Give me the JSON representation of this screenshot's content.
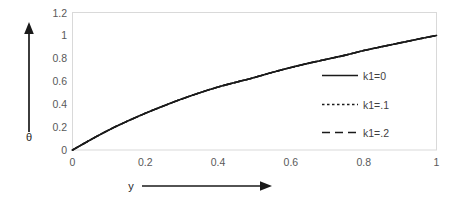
{
  "chart_data": {
    "type": "line",
    "title": "",
    "xlabel": "y",
    "ylabel": "θ",
    "xlim": [
      0,
      1
    ],
    "ylim": [
      0,
      1.2
    ],
    "grid": false,
    "legend_position": "inside-right",
    "x_ticks": [
      "0",
      "0.2",
      "0.4",
      "0.6",
      "0.8",
      "1"
    ],
    "x_tick_values": [
      0,
      0.2,
      0.4,
      0.6,
      0.8,
      1
    ],
    "y_ticks": [
      "0",
      "0.2",
      "0.4",
      "0.6",
      "0.8",
      "1",
      "1.2"
    ],
    "y_tick_values": [
      0,
      0.2,
      0.4,
      0.6,
      0.8,
      1,
      1.2
    ],
    "x": [
      0,
      0.05,
      0.1,
      0.15,
      0.2,
      0.25,
      0.3,
      0.35,
      0.4,
      0.45,
      0.5,
      0.55,
      0.6,
      0.65,
      0.7,
      0.75,
      0.8,
      0.85,
      0.9,
      0.95,
      1
    ],
    "series": [
      {
        "name": "k1=0",
        "style": "solid",
        "color": "#1a1a1a",
        "values": [
          0,
          0.09,
          0.175,
          0.25,
          0.32,
          0.385,
          0.445,
          0.5,
          0.55,
          0.592,
          0.633,
          0.678,
          0.72,
          0.758,
          0.793,
          0.828,
          0.868,
          0.902,
          0.935,
          0.968,
          1.0
        ]
      },
      {
        "name": "k1=.1",
        "style": "dotted",
        "color": "#1a1a1a",
        "values": [
          0,
          0.09,
          0.175,
          0.25,
          0.32,
          0.385,
          0.445,
          0.5,
          0.55,
          0.592,
          0.633,
          0.678,
          0.72,
          0.758,
          0.793,
          0.828,
          0.868,
          0.902,
          0.935,
          0.968,
          1.0
        ]
      },
      {
        "name": "k1=.2",
        "style": "dashed",
        "color": "#1a1a1a",
        "values": [
          0,
          0.09,
          0.175,
          0.25,
          0.32,
          0.385,
          0.445,
          0.5,
          0.55,
          0.592,
          0.633,
          0.678,
          0.72,
          0.758,
          0.793,
          0.828,
          0.868,
          0.902,
          0.935,
          0.968,
          1.0
        ]
      }
    ],
    "legend": [
      {
        "label": "k1=0",
        "style": "solid"
      },
      {
        "label": "k1=.1",
        "style": "dotted"
      },
      {
        "label": "k1=.2",
        "style": "dashed"
      }
    ],
    "annotations": {
      "y_axis_arrow": "upward-arrow",
      "x_axis_arrow": "rightward-arrow"
    },
    "colors": {
      "curve": "#1a1a1a",
      "plot_border": "#d9d9d9",
      "tick_text": "#595959",
      "axis_title": "#262626",
      "background": "#ffffff"
    }
  }
}
